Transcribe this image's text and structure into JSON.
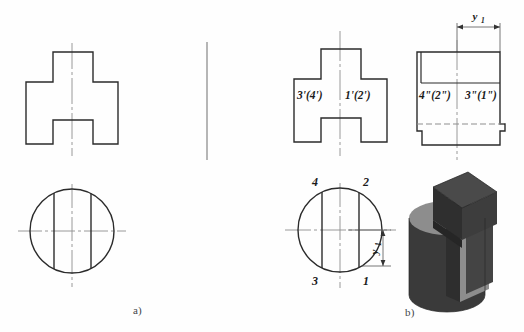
{
  "figure": {
    "background_color": "#fefefe",
    "outline_color": "#2b2b2b",
    "center_line_color": "#8e8e8e",
    "hidden_line_color": "#8e8e8e",
    "captions": [
      {
        "id": "a",
        "text": "a)"
      },
      {
        "id": "b",
        "text": "b)"
      }
    ]
  },
  "views": {
    "left_front": {
      "name": "front-view-unlabeled",
      "shape": "cross-section-outline"
    },
    "left_top": {
      "name": "top-view-unlabeled",
      "shape": "circle-with-two-chords"
    },
    "middle_front": {
      "name": "front-view-labeled",
      "labels": {
        "left": "3'(4')",
        "right": "1'(2')"
      }
    },
    "middle_top": {
      "name": "top-view-labeled",
      "point_labels": {
        "top_left": "4",
        "top_right": "2",
        "bottom_left": "3",
        "bottom_right": "1"
      },
      "dimension": {
        "symbol": "y",
        "subscript": "1",
        "orientation": "vertical"
      }
    },
    "right_side": {
      "name": "side-view-labeled",
      "labels": {
        "left": "4\"(2\")",
        "right": "3\"(1\")"
      },
      "dimension": {
        "symbol": "y",
        "subscript": "1",
        "orientation": "horizontal"
      }
    },
    "solid_model": {
      "name": "isometric-solid-model",
      "face_dark": "#383838",
      "face_mid": "#4a4a4a",
      "face_light": "#8d8d8d",
      "face_shadow": "#2e2e2e"
    }
  }
}
